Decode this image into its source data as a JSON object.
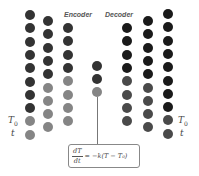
{
  "diagram": {
    "labels": {
      "encoder": "Encoder",
      "decoder": "Decoder",
      "left_T0": "T",
      "left_T0_sub": "0",
      "left_t": "t",
      "right_T0": "T",
      "right_T0_sub": "0",
      "right_t": "t"
    },
    "equation": {
      "num": "dT",
      "den": "dt",
      "rhs": "= −k(T − T₀)"
    },
    "colors": {
      "dark": "#333333",
      "black": "#1a1a1a",
      "gray": "#858585",
      "mid": "#4a4a4a"
    },
    "columns": [
      {
        "name": "encoder-col-1",
        "x": 25,
        "y_start": 10,
        "step": 13.3,
        "count": 10,
        "colors": [
          "dark",
          "dark",
          "dark",
          "dark",
          "dark",
          "dark",
          "dark",
          "dark",
          "gray",
          "gray"
        ]
      },
      {
        "name": "encoder-col-2",
        "x": 43,
        "y_start": 16,
        "step": 13.3,
        "count": 9,
        "colors": [
          "dark",
          "dark",
          "dark",
          "dark",
          "dark",
          "gray",
          "gray",
          "gray",
          "gray"
        ]
      },
      {
        "name": "encoder-col-3",
        "x": 63,
        "y_start": 23,
        "step": 13.3,
        "count": 8,
        "colors": [
          "dark",
          "dark",
          "dark",
          "dark",
          "gray",
          "gray",
          "gray",
          "gray"
        ]
      },
      {
        "name": "latent-col",
        "x": 92,
        "y_start": 61,
        "step": 13,
        "count": 3,
        "colors": [
          "dark",
          "dark",
          "gray"
        ]
      },
      {
        "name": "decoder-col-1",
        "x": 122,
        "y_start": 23,
        "step": 13.3,
        "count": 8,
        "colors": [
          "black",
          "black",
          "black",
          "black",
          "mid",
          "mid",
          "mid",
          "mid"
        ]
      },
      {
        "name": "decoder-col-2",
        "x": 143,
        "y_start": 16,
        "step": 13.3,
        "count": 9,
        "colors": [
          "black",
          "black",
          "black",
          "black",
          "black",
          "mid",
          "mid",
          "mid",
          "mid"
        ]
      },
      {
        "name": "decoder-col-3",
        "x": 163,
        "y_start": 9,
        "step": 13.3,
        "count": 10,
        "colors": [
          "black",
          "black",
          "black",
          "black",
          "black",
          "black",
          "black",
          "black",
          "mid",
          "mid"
        ]
      }
    ]
  }
}
